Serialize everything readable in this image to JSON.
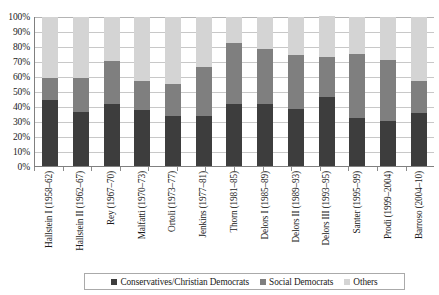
{
  "chart_data": {
    "type": "bar",
    "subtype": "stacked-bar-100-percent",
    "title": "",
    "subtitle": "",
    "xlabel": "",
    "ylabel": "",
    "ylim": [
      0,
      100
    ],
    "yticks": [
      "0%",
      "10%",
      "20%",
      "30%",
      "40%",
      "50%",
      "60%",
      "70%",
      "80%",
      "90%",
      "100%"
    ],
    "ytick_values": [
      0,
      10,
      20,
      30,
      40,
      50,
      60,
      70,
      80,
      90,
      100
    ],
    "grid": true,
    "legend_position": "bottom",
    "categories": [
      "Hallstein I (1958–62)",
      "Hallstein II (1962–67)",
      "Rey (1967–70)",
      "Malfatti (1970–73)",
      "Ortoli (1973–77)",
      "Jenkins (1977–81)",
      "Thorn (1981–85)",
      "Delors I (1985–89)",
      "Delors II (1989–93)",
      "Delors III (1993–95)",
      "Santer (1995–99)",
      "Prodi (1999–2004)",
      "Barroso (2004–10)"
    ],
    "series": [
      {
        "name": "Conservatives/Christian Democrats",
        "color": "#3d3d3d",
        "values": [
          44,
          36,
          41,
          37,
          33,
          33,
          41,
          41,
          38,
          46,
          32,
          30,
          35
        ]
      },
      {
        "name": "Social Democrats",
        "color": "#7f7f7f",
        "values": [
          15,
          23,
          29,
          20,
          22,
          33,
          41,
          37,
          36,
          27,
          43,
          41,
          22
        ]
      },
      {
        "name": "Others",
        "color": "#d4d4d4",
        "values": [
          41,
          41,
          30,
          43,
          45,
          34,
          18,
          22,
          26,
          27,
          25,
          29,
          43
        ]
      }
    ]
  },
  "legend": {
    "items": [
      {
        "label": "Conservatives/Christian Democrats"
      },
      {
        "label": "Social Democrats"
      },
      {
        "label": "Others"
      }
    ]
  }
}
